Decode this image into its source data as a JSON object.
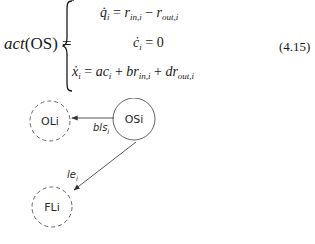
{
  "equation": {
    "lhs_func": "act",
    "lhs_arg": "(OS)",
    "equals": "=",
    "cases": [
      {
        "lhs_var": "q̇",
        "lhs_sub": "i",
        "eq": " = ",
        "rhs": [
          {
            "t": "r"
          },
          {
            "sub": "in,i"
          },
          {
            "t": " − r",
            "up": false
          },
          {
            "sub": "out,i"
          }
        ]
      },
      {
        "lhs_var": "ċ",
        "lhs_sub": "i",
        "eq": " = ",
        "rhs_text": "0"
      },
      {
        "lhs_var": "ẋ",
        "lhs_sub": "i",
        "eq": " = ",
        "rhs_text": "ac"
      }
    ],
    "case1_text": {
      "a": "r",
      "a_sub": "in,i",
      "op": " − ",
      "b": "r",
      "b_sub": "out,i"
    },
    "case3_text": {
      "t1": "ac",
      "t1_sub": "i",
      "op1": " + ",
      "t2": "br",
      "t2_sub": "in,i",
      "op2": " + ",
      "t3": "dr",
      "t3_sub": "out,i"
    },
    "number": "(4.15)"
  },
  "diagram": {
    "nodes": [
      {
        "id": "OLi",
        "label": "OLi",
        "style": "dashed"
      },
      {
        "id": "OSi",
        "label": "OSi",
        "style": "solid"
      },
      {
        "id": "FLi",
        "label": "FLi",
        "style": "dashed"
      }
    ],
    "edges": [
      {
        "from": "OSi",
        "to": "OLi",
        "label": "bls",
        "label_sub": "i"
      },
      {
        "from": "OSi",
        "to": "FLi",
        "label": "le",
        "label_sub": "i"
      }
    ]
  }
}
